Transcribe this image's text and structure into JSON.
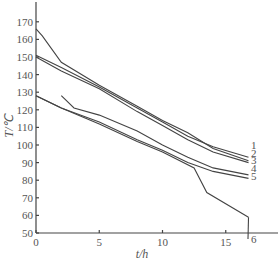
{
  "chart_data": {
    "type": "line",
    "title": "",
    "xlabel": "t/h",
    "ylabel": "T/℃",
    "xlim": [
      0,
      19
    ],
    "ylim": [
      50,
      180
    ],
    "xticks": [
      0,
      5,
      10,
      15
    ],
    "yticks": [
      50,
      60,
      70,
      80,
      90,
      100,
      110,
      120,
      130,
      140,
      150,
      160,
      170
    ],
    "grid": false,
    "legend_position": "inline-right",
    "series": [
      {
        "name": "1",
        "x": [
          0,
          2,
          5,
          8,
          10,
          12,
          14,
          16.8
        ],
        "values": [
          151,
          144,
          133,
          121,
          113,
          105,
          99,
          93
        ]
      },
      {
        "name": "2",
        "x": [
          0,
          0.5,
          2,
          5,
          8,
          10,
          12,
          14,
          16.8
        ],
        "values": [
          166,
          162,
          147,
          134,
          122,
          114,
          107,
          98,
          91
        ]
      },
      {
        "name": "3",
        "x": [
          0,
          2,
          5,
          8,
          10,
          12,
          14,
          16.8
        ],
        "values": [
          150,
          142,
          132,
          119,
          111,
          103,
          96,
          90
        ]
      },
      {
        "name": "4",
        "x": [
          2,
          3,
          5,
          8,
          10,
          12,
          14,
          16.8
        ],
        "values": [
          128,
          121,
          117,
          108,
          100,
          93,
          87,
          83
        ]
      },
      {
        "name": "5",
        "x": [
          0,
          2,
          5,
          8,
          10,
          12,
          14,
          16.8
        ],
        "values": [
          128,
          121,
          113,
          103,
          97,
          90,
          85,
          81
        ]
      },
      {
        "name": "6",
        "x": [
          0,
          2,
          5,
          8,
          10,
          12.5,
          13.5,
          16.8
        ],
        "values": [
          128,
          121,
          112,
          102,
          96,
          87,
          73,
          59
        ]
      }
    ]
  },
  "labels": {
    "x_title": "t/h",
    "y_title": "T/℃",
    "series_tags": [
      "1",
      "2",
      "3",
      "4",
      "5",
      "6"
    ]
  }
}
